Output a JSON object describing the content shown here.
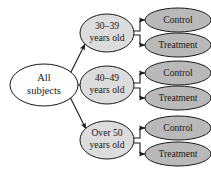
{
  "diagram": {
    "type": "tree-flow",
    "colors": {
      "root_fill": "#fdfdfd",
      "block_fill": "#dcdcdc",
      "leaf_fill": "#b9b9b9",
      "stroke": "#1a1a1a",
      "background": "#ffffff"
    },
    "root": {
      "label_line1": "All",
      "label_line2": "subjects"
    },
    "blocks": [
      {
        "id": "block-30-39",
        "label_line1": "30–39",
        "label_line2": "years old",
        "leaves": [
          {
            "id": "leaf-control-1",
            "label": "Control"
          },
          {
            "id": "leaf-treatment-1",
            "label": "Treatment"
          }
        ]
      },
      {
        "id": "block-40-49",
        "label_line1": "40–49",
        "label_line2": "years old",
        "leaves": [
          {
            "id": "leaf-control-2",
            "label": "Control"
          },
          {
            "id": "leaf-treatment-2",
            "label": "Treatment"
          }
        ]
      },
      {
        "id": "block-over-50",
        "label_line1": "Over 50",
        "label_line2": "years old",
        "leaves": [
          {
            "id": "leaf-control-3",
            "label": "Control"
          },
          {
            "id": "leaf-treatment-3",
            "label": "Treatment"
          }
        ]
      }
    ]
  }
}
